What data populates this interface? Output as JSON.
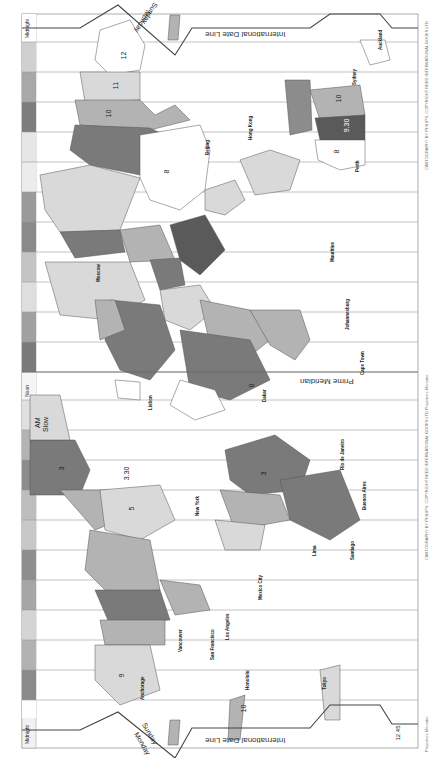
{
  "map": {
    "title": "World Time Zones",
    "orientation": "rotated 90 degrees counter-clockwise",
    "projection_note": "Projection: Mercator",
    "credit_top": "CARTOGRAPHY BY PHILIP'S. COPYRIGHT REED INTERNATIONAL BOOKS LTD",
    "credit_bottom": "CARTOGRAPHY BY PHILIP'S. COPYRIGHT REED INTERNATIONAL BOOKS LTD  Projection: Mercator",
    "colors": {
      "background": "#ffffff",
      "zone_light": "#d9d9d9",
      "zone_mid": "#b3b3b3",
      "zone_dark": "#8c8c8c",
      "zone_darker": "#6e6e6e",
      "line": "#666666",
      "date_line": "#555555"
    }
  },
  "hour_strip": {
    "top_label": "Midnight",
    "top_sub": "PM AM",
    "bottom_label": "Midnight",
    "bottom_sub": "PM AM",
    "noon_label": "Noon",
    "cells": [
      {
        "time": "12:00",
        "value": "12"
      },
      {
        "time": "23:00",
        "value": "11"
      },
      {
        "time": "22:00",
        "value": "10"
      },
      {
        "time": "21:00",
        "value": "9"
      },
      {
        "time": "20:00",
        "value": "8"
      },
      {
        "time": "19:00",
        "value": "7"
      },
      {
        "time": "18:00",
        "value": "6"
      },
      {
        "time": "17:00",
        "value": "5"
      },
      {
        "time": "16:00",
        "value": "4"
      },
      {
        "time": "15:00",
        "value": "3"
      },
      {
        "time": "14:00",
        "value": "2"
      },
      {
        "time": "13:00",
        "value": "1"
      },
      {
        "time": "12:00",
        "value": "Noon"
      },
      {
        "time": "11:00",
        "value": "1"
      },
      {
        "time": "10:00",
        "value": "2"
      },
      {
        "time": "9:00",
        "value": "3"
      },
      {
        "time": "8:00",
        "value": "4"
      },
      {
        "time": "7:00",
        "value": "5"
      },
      {
        "time": "6:00",
        "value": "6"
      },
      {
        "time": "5:00",
        "value": "7"
      },
      {
        "time": "4:00",
        "value": "8"
      },
      {
        "time": "3:00",
        "value": "9"
      },
      {
        "time": "2:00",
        "value": "10"
      },
      {
        "time": "1:00",
        "value": "11"
      },
      {
        "time": "0:00",
        "value": "12"
      }
    ]
  },
  "labels": {
    "date_line": "International Date Line",
    "prime_meridian": "Prime Meridian",
    "monday": "Monday",
    "sunday": "Sunday",
    "am_slow": "AM",
    "slow": "Slow",
    "atlantic_time": "ATLANTIC TIME",
    "eastern_time": "EASTERN TIME",
    "central_time": "CENTRAL TIME",
    "mountain_time": "MOUNTAIN TIME",
    "pacific_time": "PACIFIC TIME",
    "alaskan_time": "ALASKAN TIME"
  },
  "cities": [
    {
      "name": "Auckland"
    },
    {
      "name": "Wellington"
    },
    {
      "name": "Sydney"
    },
    {
      "name": "Perth"
    },
    {
      "name": "Tokyo"
    },
    {
      "name": "Beijing"
    },
    {
      "name": "Taipei"
    },
    {
      "name": "Hong Kong"
    },
    {
      "name": "Manila"
    },
    {
      "name": "Singapore"
    },
    {
      "name": "Jakarta"
    },
    {
      "name": "Bangkok"
    },
    {
      "name": "Calcutta"
    },
    {
      "name": "Bombay"
    },
    {
      "name": "Karachi"
    },
    {
      "name": "Moscow"
    },
    {
      "name": "Mauritius"
    },
    {
      "name": "Johannesburg"
    },
    {
      "name": "Cape Town"
    },
    {
      "name": "Addis Ababa"
    },
    {
      "name": "Nairobi"
    },
    {
      "name": "Cairo"
    },
    {
      "name": "Istanbul"
    },
    {
      "name": "Athens"
    },
    {
      "name": "Berlin"
    },
    {
      "name": "Paris"
    },
    {
      "name": "London"
    },
    {
      "name": "Lisbon"
    },
    {
      "name": "Dakar"
    },
    {
      "name": "Abidjan"
    },
    {
      "name": "Rio de Janeiro"
    },
    {
      "name": "Buenos Aires"
    },
    {
      "name": "Santiago"
    },
    {
      "name": "Lima"
    },
    {
      "name": "Bogota"
    },
    {
      "name": "Caracas"
    },
    {
      "name": "San Juan"
    },
    {
      "name": "Panama City"
    },
    {
      "name": "Miami"
    },
    {
      "name": "New York"
    },
    {
      "name": "Chicago"
    },
    {
      "name": "Mexico City"
    },
    {
      "name": "Denver"
    },
    {
      "name": "Los Angeles"
    },
    {
      "name": "San Francisco"
    },
    {
      "name": "Vancouver"
    },
    {
      "name": "Anchorage"
    },
    {
      "name": "Honolulu"
    },
    {
      "name": "Tahiti"
    }
  ],
  "zone_numbers": {
    "nz": "12",
    "nz_alt": "12.45",
    "australia_e": "10",
    "australia_c": "9.30",
    "australia_w": "8",
    "fiji": "12",
    "solomon": "11",
    "png": "10",
    "japan": "9",
    "china": "8",
    "indochina": "7",
    "india": "5.30",
    "nepal": "5.45",
    "pakistan": "5",
    "iran": "3.30",
    "arabia": "3",
    "moscow": "3",
    "east_africa": "3",
    "south_africa": "2",
    "europe_c": "1",
    "uk": "0",
    "west_africa": "0",
    "azores": "1",
    "brazil": "3",
    "argentina": "3",
    "chile": "4",
    "peru": "5",
    "venezuela": "4",
    "newfoundland": "3.30",
    "atlantic": "4",
    "eastern": "5",
    "central": "6",
    "mountain": "7",
    "pacific": "8",
    "alaska": "9",
    "hawaii": "10",
    "samoa": "11",
    "greenland": "3",
    "kamchatka": "12",
    "magadan": "11",
    "vladivostok": "10",
    "yakutsk": "9",
    "myanmar": "6.30",
    "sri_lanka": "5.30",
    "mauritius": "4",
    "gulf": "4",
    "marquesas": "9.30",
    "midway": "11",
    "kiribati": "12",
    "line_isl": "13",
    "chatham": "12.45",
    "s_georgia": "2",
    "fernando": "2"
  }
}
